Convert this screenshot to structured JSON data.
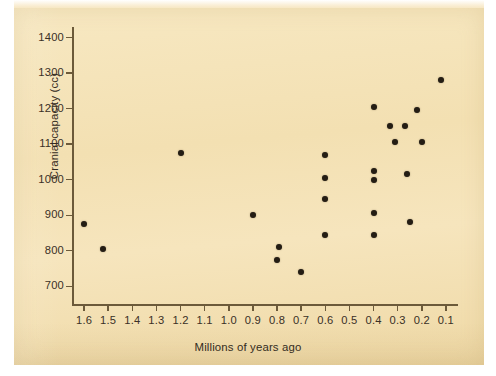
{
  "figure": {
    "background_color": "#ffffff",
    "plate_color": "#f5e3b8",
    "point_color": "#241d14",
    "axis_color": "#6c5a3a"
  },
  "chart_data": {
    "type": "scatter",
    "title": "",
    "xlabel": "Millions of years ago",
    "ylabel": "Cranial capacity (cc)",
    "xlim": [
      1.65,
      0.05
    ],
    "ylim": [
      650,
      1430
    ],
    "x_inverted": true,
    "grid": false,
    "legend": null,
    "xticks": [
      1.6,
      1.5,
      1.4,
      1.3,
      1.2,
      1.1,
      1.0,
      0.9,
      0.8,
      0.7,
      0.6,
      0.5,
      0.4,
      0.3,
      0.2,
      0.1
    ],
    "xticklabels": [
      "1.6",
      "1.5",
      "1.4",
      "1.3",
      "1.2",
      "1.1",
      "1.0",
      "0.9",
      "0.8",
      "0.7",
      "0.6",
      "0.5",
      "0.4",
      "0.3",
      "0.2",
      "0.1"
    ],
    "yticks": [
      700,
      800,
      900,
      1000,
      1100,
      1200,
      1300,
      1400
    ],
    "yticklabels": [
      "700",
      "800",
      "900",
      "1000",
      "1100",
      "1200",
      "1300",
      "1400"
    ],
    "points": [
      {
        "x": 1.6,
        "y": 875
      },
      {
        "x": 1.52,
        "y": 805
      },
      {
        "x": 1.2,
        "y": 1075
      },
      {
        "x": 0.9,
        "y": 900
      },
      {
        "x": 0.79,
        "y": 810
      },
      {
        "x": 0.8,
        "y": 775
      },
      {
        "x": 0.7,
        "y": 740
      },
      {
        "x": 0.6,
        "y": 1070
      },
      {
        "x": 0.6,
        "y": 1005
      },
      {
        "x": 0.6,
        "y": 945
      },
      {
        "x": 0.6,
        "y": 845
      },
      {
        "x": 0.4,
        "y": 1205
      },
      {
        "x": 0.4,
        "y": 1025
      },
      {
        "x": 0.4,
        "y": 1000
      },
      {
        "x": 0.4,
        "y": 905
      },
      {
        "x": 0.4,
        "y": 845
      },
      {
        "x": 0.33,
        "y": 1150
      },
      {
        "x": 0.31,
        "y": 1105
      },
      {
        "x": 0.27,
        "y": 1150
      },
      {
        "x": 0.26,
        "y": 1015
      },
      {
        "x": 0.25,
        "y": 880
      },
      {
        "x": 0.22,
        "y": 1195
      },
      {
        "x": 0.2,
        "y": 1105
      },
      {
        "x": 0.12,
        "y": 1280
      }
    ]
  }
}
